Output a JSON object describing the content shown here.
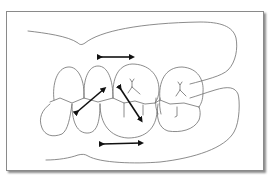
{
  "figure": {
    "type": "dental occlusion diagram",
    "description": "Line drawing of upper and lower posterior teeth in occlusion with double-headed arrows indicating movement directions",
    "colors": {
      "outline": "#6e6e6e",
      "arrow": "#111111",
      "frame_border": "#8a8a8a",
      "background": "#ffffff"
    },
    "arrows": [
      {
        "id": "upper-horizontal",
        "direction": "horizontal"
      },
      {
        "id": "left-diagonal",
        "direction": "diagonal-up-right"
      },
      {
        "id": "right-diagonal",
        "direction": "diagonal-down-right"
      },
      {
        "id": "lower-horizontal",
        "direction": "horizontal"
      }
    ],
    "elements": {
      "upper_gum": "upper gingiva outline",
      "lower_gum": "lower gingiva outline",
      "upper_teeth_count": 4,
      "lower_teeth_count": 4
    }
  }
}
